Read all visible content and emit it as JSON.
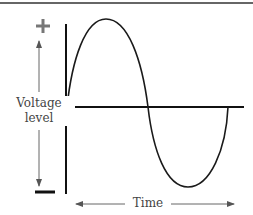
{
  "diagram": {
    "positive_symbol": "+",
    "negative_symbol": "−",
    "y_label_line1": "Voltage",
    "y_label_line2": "level",
    "x_label": "Time",
    "waveform": "sine",
    "colors": {
      "curve": "#1a1a1a",
      "axis": "#111111",
      "arrow": "#555555",
      "plus": "#777777",
      "minus": "#111111"
    }
  }
}
